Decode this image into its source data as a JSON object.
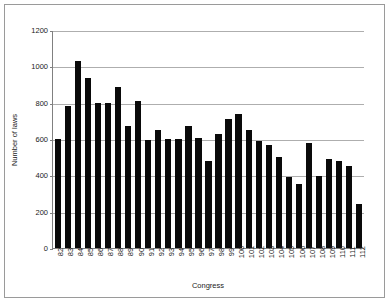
{
  "chart_data": {
    "type": "bar",
    "title": "",
    "xlabel": "Congress",
    "ylabel": "Number of laws",
    "categories": [
      "82",
      "83",
      "84",
      "85",
      "86",
      "87",
      "88",
      "89",
      "90",
      "91",
      "92",
      "93",
      "94",
      "95",
      "96",
      "97",
      "98",
      "99",
      "100",
      "101",
      "102",
      "103",
      "104",
      "105",
      "106",
      "107",
      "108",
      "109",
      "110",
      "111",
      "112"
    ],
    "values": [
      600,
      780,
      1030,
      935,
      800,
      800,
      885,
      670,
      810,
      595,
      650,
      600,
      600,
      670,
      605,
      480,
      630,
      710,
      740,
      650,
      590,
      565,
      500,
      390,
      350,
      580,
      395,
      490,
      480,
      450,
      240
    ],
    "ylim": [
      0,
      1200
    ],
    "yticks": [
      0,
      200,
      400,
      600,
      800,
      1000,
      1200
    ],
    "ytick_labels": [
      "0",
      "200",
      "400",
      "600",
      "800",
      "1000",
      "1200"
    ],
    "grid": true,
    "legend": false,
    "bar_color": "#0a0a0a",
    "gridline_color": "#aeaeae",
    "axis_color": "#808080",
    "frame_color": "#9a9a9a",
    "background": "#ffffff"
  }
}
